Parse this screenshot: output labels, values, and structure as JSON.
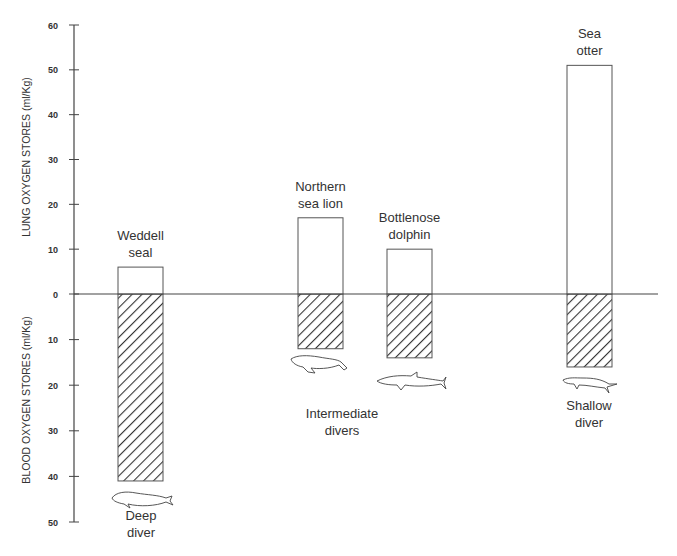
{
  "chart_data": {
    "type": "bar",
    "title": "",
    "ylabel_upper": "LUNG OXYGEN STORES (ml/Kg)",
    "ylabel_lower": "BLOOD OXYGEN STORES (ml/Kg)",
    "upper_ticks": [
      0,
      10,
      20,
      30,
      40,
      50,
      60
    ],
    "lower_ticks": [
      10,
      20,
      30,
      40,
      50
    ],
    "ylim_upper": [
      0,
      60
    ],
    "ylim_lower": [
      0,
      50
    ],
    "grid": false,
    "categories": [
      "Weddell seal",
      "Northern sea lion",
      "Bottlenose dolphin",
      "Sea otter"
    ],
    "label_lines": [
      [
        "Weddell",
        "seal"
      ],
      [
        "Northern",
        "sea lion"
      ],
      [
        "Bottlenose",
        "dolphin"
      ],
      [
        "Sea",
        "otter"
      ]
    ],
    "series": [
      {
        "name": "Lung oxygen stores (ml/Kg)",
        "style": "open",
        "values": [
          6,
          17,
          10,
          51
        ]
      },
      {
        "name": "Blood oxygen stores (ml/Kg)",
        "style": "hatched",
        "values": [
          41,
          12,
          14,
          16
        ]
      }
    ],
    "annotations": [
      {
        "text": [
          "Deep",
          "diver"
        ],
        "applies_to": [
          "Weddell seal"
        ]
      },
      {
        "text": [
          "Intermediate",
          "divers"
        ],
        "applies_to": [
          "Northern sea lion",
          "Bottlenose dolphin"
        ]
      },
      {
        "text": [
          "Shallow",
          "diver"
        ],
        "applies_to": [
          "Sea otter"
        ]
      }
    ],
    "icons": [
      "seal-icon",
      "sea-lion-icon",
      "dolphin-icon",
      "otter-icon"
    ]
  }
}
